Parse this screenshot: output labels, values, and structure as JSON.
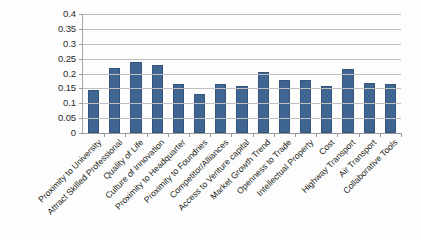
{
  "chart_data": {
    "type": "bar",
    "title": "",
    "subtitle": "",
    "xlabel": "",
    "ylabel": "",
    "ylim": [
      0,
      0.4
    ],
    "grid": true,
    "legend": "none",
    "series_name": "",
    "bar_color": "#3F6593",
    "gridline_color": "#BFBFBF",
    "axis_color": "#9A9A9A",
    "y_ticks": [
      "0.4",
      "0.35",
      "0.3",
      "0.25",
      "0.2",
      "0.15",
      "0.1",
      "0.05",
      "0"
    ],
    "y_tick_values": [
      0.4,
      0.35,
      0.3,
      0.25,
      0.2,
      0.15,
      0.1,
      0.05,
      0
    ],
    "categories": [
      "Proximity to University",
      "Attract Skilled Professional",
      "Quality of Life",
      "Culture of Innovation",
      "Proximity to Headquarter",
      "Proximity to Foundries",
      "Competitor/Alliances",
      "Access to Venture capital",
      "Market Growth Trend",
      "Openness to Trade",
      "Intellectual Property",
      "Cost",
      "Highway Transport",
      "Air Transport",
      "Collaborative Tools"
    ],
    "values": [
      0.143,
      0.218,
      0.238,
      0.228,
      0.166,
      0.131,
      0.166,
      0.157,
      0.205,
      0.178,
      0.178,
      0.157,
      0.216,
      0.167,
      0.166
    ]
  }
}
